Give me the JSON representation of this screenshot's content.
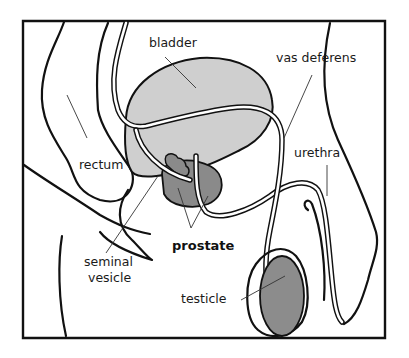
{
  "diagram": {
    "labels": {
      "bladder": "bladder",
      "vas_deferens": "vas deferens",
      "rectum": "rectum",
      "urethra": "urethra",
      "seminal_vesicle_line1": "seminal",
      "seminal_vesicle_line2": "vesicle",
      "prostate": "prostate",
      "testicle": "testicle"
    },
    "colors": {
      "background": "#ffffff",
      "frame": "#111111",
      "bladder_fill": "#cfcfcf",
      "prostate_fill": "#8a8a8a",
      "testicle_fill": "#8c8c8c",
      "seminal_vesicle_fill": "#8a8a8a",
      "outline": "#111111"
    }
  }
}
